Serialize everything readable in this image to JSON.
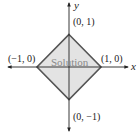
{
  "figure": {
    "axes": {
      "x_label": "x",
      "y_label": "y"
    },
    "region": {
      "label": "Solution",
      "fill_color": "#e3e3e3",
      "edge_color": "#555555",
      "vertices": [
        {
          "x": 0,
          "y": 1,
          "label": "(0, 1)"
        },
        {
          "x": 1,
          "y": 0,
          "label": "(1, 0)"
        },
        {
          "x": 0,
          "y": -1,
          "label": "(0, −1)"
        },
        {
          "x": -1,
          "y": 0,
          "label": "(−1, 0)"
        }
      ]
    }
  }
}
